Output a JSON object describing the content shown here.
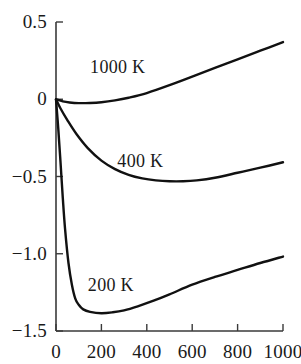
{
  "chart_data": {
    "type": "line",
    "title": "",
    "xlabel": "",
    "ylabel": "",
    "xlim": [
      0,
      1000
    ],
    "ylim": [
      -1.5,
      0.5
    ],
    "grid": false,
    "legend_position": "inline-curve-labels",
    "xticks": [
      0,
      200,
      400,
      600,
      800,
      1000
    ],
    "xtick_labels": [
      "0",
      "200",
      "400",
      "600",
      "800",
      "1000"
    ],
    "yticks": [
      0.5,
      0,
      -0.5,
      -1.0,
      -1.5
    ],
    "ytick_labels": [
      "0.5",
      "0",
      "−0.5",
      "−1.0",
      "−1.5"
    ],
    "line_color": "#111111",
    "axis_color": "#3a3a3a",
    "series": [
      {
        "name": "1000 K",
        "label": "1000 K",
        "x": [
          0,
          30,
          60,
          100,
          150,
          200,
          260,
          320,
          400,
          500,
          600,
          700,
          800,
          900,
          1000
        ],
        "values": [
          0.0,
          -0.014,
          -0.021,
          -0.025,
          -0.024,
          -0.019,
          -0.007,
          0.01,
          0.04,
          0.091,
          0.147,
          0.203,
          0.258,
          0.314,
          0.37
        ]
      },
      {
        "name": "400 K",
        "label": "400 K",
        "x": [
          0,
          20,
          50,
          90,
          140,
          200,
          260,
          320,
          380,
          440,
          500,
          560,
          620,
          700,
          800,
          900,
          1000
        ],
        "values": [
          0.0,
          -0.06,
          -0.135,
          -0.225,
          -0.316,
          -0.397,
          -0.452,
          -0.489,
          -0.512,
          -0.525,
          -0.531,
          -0.531,
          -0.525,
          -0.508,
          -0.476,
          -0.443,
          -0.408
        ]
      },
      {
        "name": "200 K",
        "label": "200 K",
        "x": [
          0,
          10,
          20,
          30,
          40,
          55,
          70,
          85,
          100,
          120,
          150,
          200,
          250,
          300,
          360,
          430,
          500,
          600,
          700,
          800,
          900,
          1000
        ],
        "values": [
          0.0,
          -0.19,
          -0.41,
          -0.64,
          -0.84,
          -1.06,
          -1.2,
          -1.29,
          -1.33,
          -1.36,
          -1.376,
          -1.385,
          -1.379,
          -1.366,
          -1.34,
          -1.304,
          -1.263,
          -1.2,
          -1.15,
          -1.105,
          -1.06,
          -1.018
        ]
      }
    ],
    "series_label_positions": [
      {
        "name": "1000 K",
        "x": 300,
        "y": 0.21
      },
      {
        "name": "400 K",
        "x": 420,
        "y": -0.4
      },
      {
        "name": "200 K",
        "x": 290,
        "y": -1.2
      }
    ]
  }
}
